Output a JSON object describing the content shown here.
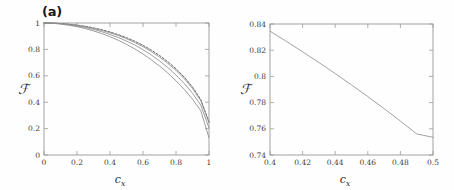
{
  "figure": {
    "panel_a_label": "(a)",
    "panel_b_label": "(b)"
  },
  "chart_data": [
    {
      "type": "line",
      "panel": "(a)",
      "title": "",
      "xlabel": "c_x",
      "ylabel": "F",
      "xlim": [
        0,
        1
      ],
      "ylim": [
        0,
        1
      ],
      "xticks": [
        0,
        0.2,
        0.4,
        0.6,
        0.8,
        1
      ],
      "xticklabels": [
        "0",
        "0.2",
        "0.4",
        "0.6",
        "0.8",
        "1"
      ],
      "yticks": [
        0,
        0.2,
        0.4,
        0.6,
        0.8,
        1
      ],
      "yticklabels": [
        "0",
        "0.2",
        "0.4",
        "0.6",
        "0.8",
        "1"
      ],
      "grid": false,
      "legend": "none",
      "x": [
        0,
        0.05,
        0.1,
        0.15,
        0.2,
        0.25,
        0.3,
        0.35,
        0.4,
        0.45,
        0.5,
        0.55,
        0.6,
        0.65,
        0.7,
        0.75,
        0.8,
        0.85,
        0.9,
        0.95,
        1.0
      ],
      "series": [
        {
          "name": "curve-dashed-upper",
          "style": "dashed",
          "values": [
            1.0,
            0.999,
            0.996,
            0.991,
            0.984,
            0.975,
            0.963,
            0.949,
            0.932,
            0.912,
            0.889,
            0.862,
            0.831,
            0.795,
            0.754,
            0.707,
            0.653,
            0.59,
            0.515,
            0.42,
            0.25
          ]
        },
        {
          "name": "curve-solid-upper",
          "style": "solid",
          "values": [
            1.0,
            0.999,
            0.996,
            0.99,
            0.982,
            0.972,
            0.959,
            0.944,
            0.926,
            0.905,
            0.881,
            0.853,
            0.821,
            0.784,
            0.742,
            0.695,
            0.641,
            0.578,
            0.504,
            0.412,
            0.245
          ]
        },
        {
          "name": "curve-solid-middle",
          "style": "solid",
          "values": [
            1.0,
            0.998,
            0.994,
            0.987,
            0.978,
            0.966,
            0.951,
            0.934,
            0.913,
            0.89,
            0.863,
            0.833,
            0.798,
            0.758,
            0.713,
            0.663,
            0.606,
            0.542,
            0.468,
            0.378,
            0.205
          ]
        },
        {
          "name": "curve-solid-lower",
          "style": "solid",
          "values": [
            1.0,
            0.998,
            0.992,
            0.983,
            0.972,
            0.958,
            0.94,
            0.92,
            0.896,
            0.869,
            0.838,
            0.804,
            0.765,
            0.722,
            0.674,
            0.621,
            0.562,
            0.497,
            0.423,
            0.336,
            0.13
          ]
        }
      ]
    },
    {
      "type": "line",
      "panel": "(b)",
      "title": "",
      "xlabel": "c_x",
      "ylabel": "F",
      "xlim": [
        0.4,
        0.5
      ],
      "ylim": [
        0.74,
        0.84
      ],
      "xticks": [
        0.4,
        0.42,
        0.44,
        0.46,
        0.48,
        0.5
      ],
      "xticklabels": [
        "0.4",
        "0.42",
        "0.44",
        "0.46",
        "0.48",
        "0.5"
      ],
      "yticks": [
        0.74,
        0.76,
        0.78,
        0.8,
        0.82,
        0.84
      ],
      "yticklabels": [
        "0.74",
        "0.76",
        "0.78",
        "0.8",
        "0.82",
        "0.84"
      ],
      "grid": false,
      "legend": "none",
      "x": [
        0.4,
        0.41,
        0.42,
        0.43,
        0.44,
        0.45,
        0.46,
        0.47,
        0.48,
        0.49,
        0.5
      ],
      "series": [
        {
          "name": "curve-zoom",
          "style": "solid",
          "values": [
            0.8345,
            0.8268,
            0.8188,
            0.8106,
            0.8022,
            0.7935,
            0.7846,
            0.7754,
            0.7659,
            0.7561,
            0.7535
          ]
        }
      ]
    }
  ]
}
